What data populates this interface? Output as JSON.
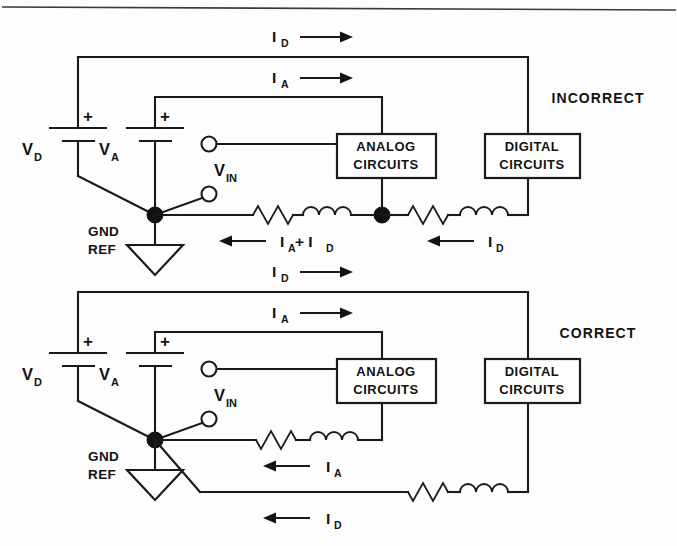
{
  "figure": {
    "type": "schematic",
    "page_rule": true
  },
  "circuits": [
    {
      "id": "incorrect",
      "verdict_label": "INCORRECT",
      "supplies": [
        {
          "name": "V",
          "subscript": "D",
          "polarity": "+"
        },
        {
          "name": "V",
          "subscript": "A",
          "polarity": "+"
        }
      ],
      "input": {
        "name": "V",
        "subscript": "IN"
      },
      "ground": {
        "line1": "GND",
        "line2": "REF"
      },
      "blocks": [
        {
          "line1": "ANALOG",
          "line2": "CIRCUITS"
        },
        {
          "line1": "DIGITAL",
          "line2": "CIRCUITS"
        }
      ],
      "top_currents": [
        {
          "name": "I",
          "subscript": "D",
          "direction": "right"
        },
        {
          "name": "I",
          "subscript": "A",
          "direction": "right"
        }
      ],
      "return_currents": [
        {
          "text": "I",
          "subscript": "A",
          "extra": " + I",
          "extra_subscript": "D",
          "direction": "left"
        },
        {
          "text": "I",
          "subscript": "D",
          "extra": "",
          "extra_subscript": "",
          "direction": "left"
        }
      ],
      "impedances": 4
    },
    {
      "id": "correct",
      "verdict_label": "CORRECT",
      "supplies": [
        {
          "name": "V",
          "subscript": "D",
          "polarity": "+"
        },
        {
          "name": "V",
          "subscript": "A",
          "polarity": "+"
        }
      ],
      "input": {
        "name": "V",
        "subscript": "IN"
      },
      "ground": {
        "line1": "GND",
        "line2": "REF"
      },
      "blocks": [
        {
          "line1": "ANALOG",
          "line2": "CIRCUITS"
        },
        {
          "line1": "DIGITAL",
          "line2": "CIRCUITS"
        }
      ],
      "top_currents": [
        {
          "name": "I",
          "subscript": "D",
          "direction": "right"
        },
        {
          "name": "I",
          "subscript": "A",
          "direction": "right"
        }
      ],
      "return_currents": [
        {
          "text": "I",
          "subscript": "A",
          "extra": "",
          "extra_subscript": "",
          "direction": "left"
        },
        {
          "text": "I",
          "subscript": "D",
          "extra": "",
          "extra_subscript": "",
          "direction": "left"
        }
      ],
      "impedances": 4
    }
  ],
  "colors": {
    "ink": "#121212",
    "line": "#1a1a1a",
    "paper": "#fdfdfd"
  }
}
